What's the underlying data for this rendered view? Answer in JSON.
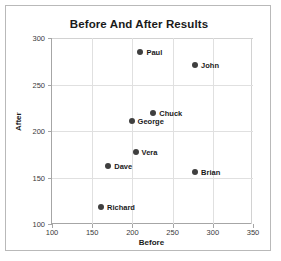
{
  "chart_data": {
    "type": "scatter",
    "title": "Before And After Results",
    "xlabel": "Before",
    "ylabel": "After",
    "xlim": [
      100,
      350
    ],
    "ylim": [
      100,
      300
    ],
    "xticks": [
      100,
      150,
      200,
      250,
      300,
      350
    ],
    "yticks": [
      100,
      150,
      200,
      250,
      300
    ],
    "grid": true,
    "legend": "none",
    "marker_color": "#3f3f3f",
    "points": [
      {
        "label": "Paul",
        "x": 210,
        "y": 285,
        "label_side": "right"
      },
      {
        "label": "John",
        "x": 278,
        "y": 271,
        "label_side": "right"
      },
      {
        "label": "Chuck",
        "x": 226,
        "y": 219,
        "label_side": "right"
      },
      {
        "label": "George",
        "x": 199,
        "y": 211,
        "label_side": "right"
      },
      {
        "label": "Vera",
        "x": 204,
        "y": 177,
        "label_side": "right"
      },
      {
        "label": "Dave",
        "x": 170,
        "y": 162,
        "label_side": "right"
      },
      {
        "label": "Brian",
        "x": 278,
        "y": 156,
        "label_side": "right"
      },
      {
        "label": "Richard",
        "x": 161,
        "y": 118,
        "label_side": "right"
      }
    ]
  }
}
